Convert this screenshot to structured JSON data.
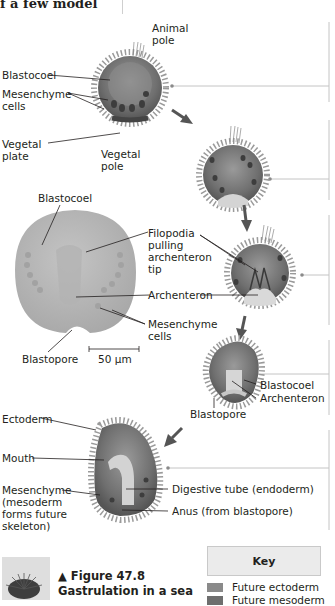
{
  "header": {
    "prev_text_fragment": "f a few model"
  },
  "figure": {
    "number_label": "▲ Figure 47.8",
    "title_line": "Gastrulation in a sea",
    "stage1": {
      "animal_pole": [
        "Animal",
        "pole"
      ],
      "blastocoel": "Blastocoel",
      "mesenchyme_cells": [
        "Mesenchyme",
        "cells"
      ],
      "vegetal_plate": [
        "Vegetal",
        "plate"
      ],
      "vegetal_pole": [
        "Vegetal",
        "pole"
      ]
    },
    "micrograph": {
      "blastocoel": "Blastocoel",
      "filopodia": [
        "Filopodia",
        "pulling",
        "archenteron",
        "tip"
      ],
      "archenteron": "Archenteron",
      "mesenchyme_cells": [
        "Mesenchyme",
        "cells"
      ],
      "blastopore": "Blastopore",
      "scale_bar": "50 µm"
    },
    "stage4": {
      "blastocoel": "Blastocoel",
      "archenteron": "Archenteron",
      "blastopore": "Blastopore"
    },
    "stage5": {
      "ectoderm": "Ectoderm",
      "mouth": "Mouth",
      "mesenchyme": [
        "Mesenchyme",
        "(mesoderm",
        "forms future",
        "skeleton)"
      ],
      "digestive_tube": "Digestive tube (endoderm)",
      "anus": "Anus (from blastopore)"
    },
    "key": {
      "title": "Key",
      "items": [
        {
          "label": "Future ectoderm",
          "color": "#8a8a8a"
        },
        {
          "label": "Future mesoderm",
          "color": "#6e6e6e"
        }
      ]
    },
    "colors": {
      "embryo_outer": "#7d7d7d",
      "embryo_dark": "#4a4a4a",
      "embryo_light": "#c9c9c9",
      "micrograph": "#b9b9b9",
      "arrow": "#5a5a5a",
      "connector": "#b5b5b5"
    }
  }
}
